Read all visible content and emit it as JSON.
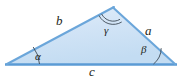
{
  "figure": {
    "name": "labeled-triangle-diagram",
    "background_color": "#ffffff",
    "fill_color": "#cfe4f5",
    "fill_color_light": "#ddeaf7",
    "stroke_color": "#5b9bd5",
    "arc_color": "#3d4a55",
    "label_color": "#231f20",
    "vertices": {
      "left": {
        "x": 8,
        "y": 64
      },
      "right": {
        "x": 174,
        "y": 64
      },
      "apex": {
        "x": 113,
        "y": 8
      }
    },
    "sides": [
      {
        "key": "a",
        "label": "a",
        "from": "apex",
        "to": "right"
      },
      {
        "key": "b",
        "label": "b",
        "from": "left",
        "to": "apex"
      },
      {
        "key": "c",
        "label": "c",
        "from": "left",
        "to": "right"
      }
    ],
    "angles": [
      {
        "key": "alpha",
        "label": "α",
        "vertex": "left",
        "arcs": 1
      },
      {
        "key": "beta",
        "label": "β",
        "vertex": "right",
        "arcs": 1
      },
      {
        "key": "gamma",
        "label": "γ",
        "vertex": "apex",
        "arcs": 2
      }
    ]
  }
}
